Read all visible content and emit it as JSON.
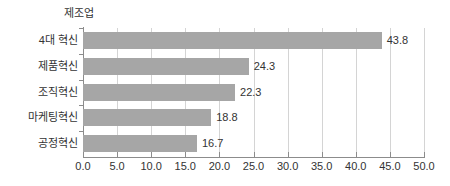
{
  "chart_data": {
    "type": "bar",
    "orientation": "horizontal",
    "title": "제조업",
    "xlabel": "",
    "ylabel": "",
    "categories": [
      "4대 혁신",
      "제품혁신",
      "조직혁신",
      "마케팅혁신",
      "공정혁신"
    ],
    "values": [
      43.8,
      24.3,
      22.3,
      18.8,
      16.7
    ],
    "value_labels": [
      "43.8",
      "24.3",
      "22.3",
      "18.8",
      "16.7"
    ],
    "xlim": [
      0.0,
      50.0
    ],
    "xticks": [
      0.0,
      5.0,
      10.0,
      15.0,
      20.0,
      25.0,
      30.0,
      35.0,
      40.0,
      45.0,
      50.0
    ],
    "xtick_labels": [
      "0.0",
      "5.0",
      "10.0",
      "15.0",
      "20.0",
      "25.0",
      "30.0",
      "35.0",
      "40.0",
      "45.0",
      "50.0"
    ],
    "grid": "vertical",
    "legend": null,
    "colors": {
      "bar": "#a6a6a6",
      "grid": "#d4d4d4",
      "axis": "#8c8c8c",
      "text": "#333333",
      "background": "#ffffff"
    }
  }
}
